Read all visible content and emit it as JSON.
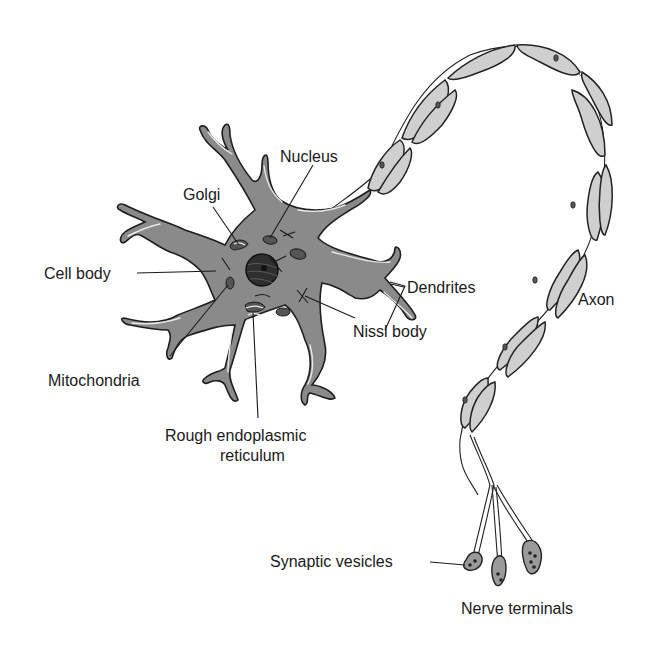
{
  "diagram": {
    "labels": {
      "nucleus": "Nucleus",
      "golgi": "Golgi",
      "cell_body": "Cell body",
      "dendrites": "Dendrites",
      "axon": "Axon",
      "nissl_body": "Nissl body",
      "mitochondria": "Mitochondria",
      "rough_er_line1": "Rough endoplasmic",
      "rough_er_line2": "reticulum",
      "synaptic_vesicles": "Synaptic vesicles",
      "nerve_terminals": "Nerve terminals"
    },
    "colors": {
      "cell_fill": "#8a8a8a",
      "myelin_fill": "#cfcfcf",
      "outline": "#1e1e1e",
      "background": "#ffffff"
    }
  }
}
